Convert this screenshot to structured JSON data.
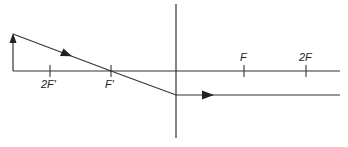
{
  "diagram": {
    "colors": {
      "line": "#333333",
      "background": "#ffffff"
    },
    "axis": {
      "y": 71,
      "x_start": 13,
      "x_end": 340
    },
    "lens": {
      "x": 176,
      "y_top": 4,
      "y_bottom": 138
    },
    "object_arrow": {
      "x": 13,
      "y_base": 71,
      "y_tip": 34
    },
    "ray": {
      "points": [
        [
          13,
          34
        ],
        [
          111,
          71
        ],
        [
          176,
          95
        ],
        [
          340,
          95
        ]
      ],
      "arrowheads": [
        [
          66,
          54
        ],
        [
          206,
          95
        ]
      ]
    },
    "ticks": [
      {
        "label": "2F′",
        "x": 50,
        "label_pos": "below"
      },
      {
        "label": "F′",
        "x": 111,
        "label_pos": "below"
      },
      {
        "label": "F",
        "x": 244,
        "label_pos": "above"
      },
      {
        "label": "2F",
        "x": 306,
        "label_pos": "above"
      }
    ]
  }
}
